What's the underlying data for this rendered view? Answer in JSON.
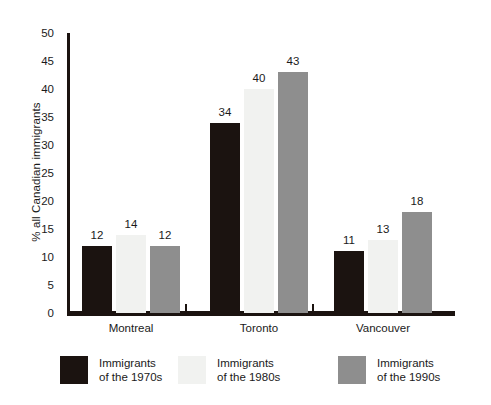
{
  "chart_data": {
    "type": "bar",
    "title": "",
    "subtitle": "",
    "xlabel": "",
    "ylabel": "% all Canadian immigrants",
    "categories": [
      "Montreal",
      "Toronto",
      "Vancouver"
    ],
    "series": [
      {
        "name": "Immigrants of the 1970s",
        "values": [
          12,
          34,
          11
        ],
        "color": "#1b1310"
      },
      {
        "name": "Immigrants of the 1980s",
        "values": [
          14,
          40,
          13
        ],
        "color": "#f1f2f0"
      },
      {
        "name": "Immigrants of the 1990s",
        "values": [
          12,
          43,
          18
        ],
        "color": "#8e8e8e"
      }
    ],
    "ylim": [
      0,
      50
    ],
    "yticks": [
      0,
      5,
      10,
      15,
      20,
      25,
      30,
      35,
      40,
      45,
      50
    ],
    "ytick_labels": [
      "0",
      "5",
      "10",
      "15",
      "20",
      "25",
      "30",
      "35",
      "40",
      "45",
      "50"
    ],
    "grid": false,
    "legend_position": "bottom",
    "data_labels": true,
    "axis_color": "#1b1310",
    "background_color": "#ffffff"
  },
  "legend": [
    {
      "line1": "Immigrants",
      "line2": "of the 1970s",
      "color": "#1b1310"
    },
    {
      "line1": "Immigrants",
      "line2": "of the 1980s",
      "color": "#f1f2f0"
    },
    {
      "line1": "Immigrants",
      "line2": "of the 1990s",
      "color": "#8e8e8e"
    }
  ]
}
